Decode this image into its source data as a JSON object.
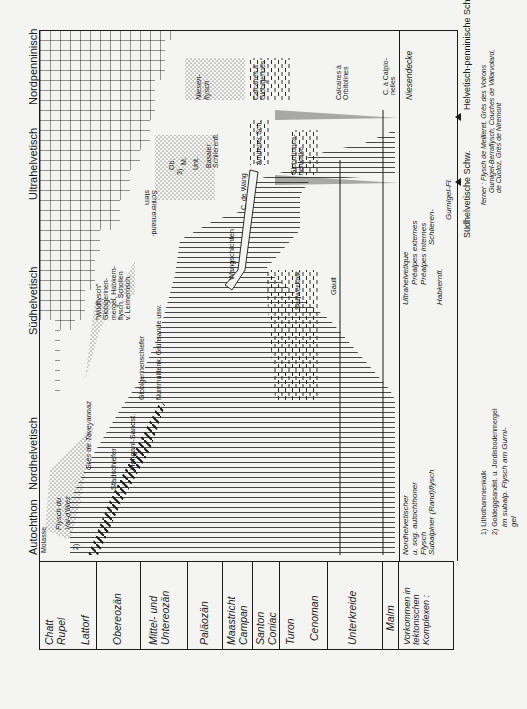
{
  "diagram": {
    "title_headers": [
      {
        "label": "Autochthon",
        "x": 40
      },
      {
        "label": "Nordhelvetisch",
        "x": 100
      },
      {
        "label": "Südhelvetisch",
        "x": 250
      },
      {
        "label": "Ultrahelvetisch",
        "x": 405
      },
      {
        "label": "Nordpenninisch",
        "x": 585
      }
    ],
    "time_column": [
      {
        "lines": [
          "Chatt",
          "Rupel"
        ],
        "sub": "Lattorf",
        "y0": 39,
        "y1": 97
      },
      {
        "lines": [
          "Obereozän"
        ],
        "y0": 97,
        "y1": 141
      },
      {
        "lines": [
          "Mittel- und",
          "Untereozän"
        ],
        "y0": 141,
        "y1": 188
      },
      {
        "lines": [
          "Paläozän"
        ],
        "y0": 188,
        "y1": 223
      },
      {
        "lines": [
          "Maastricht",
          "Campan"
        ],
        "y0": 223,
        "y1": 253
      },
      {
        "lines": [
          "Santon",
          "Coniac"
        ],
        "y0": 253,
        "y1": 280
      },
      {
        "lines": [
          "Turon",
          "Cenoman"
        ],
        "y0": 280,
        "y1": 328
      },
      {
        "lines": [
          "Unterkreide"
        ],
        "y0": 328,
        "y1": 383
      },
      {
        "lines": [
          "Malm"
        ],
        "y0": 383,
        "y1": 399
      },
      {
        "lines": [
          "Vorkommen in",
          "tektonischen",
          "Komplexen :"
        ],
        "y0": 399,
        "y1": 454
      }
    ],
    "units": {
      "molasse": "Molasse",
      "flysch_val_illiez": [
        "Flysch du",
        "Val-d'Illiez"
      ],
      "footnote_2_marker": "2)",
      "gres_taveyannaz": "Grès de Taveyannaz",
      "stadschiefer": "Stadschiefer",
      "hohgant": "Hohgant-Sandst.",
      "nummulitenk": "Nummulitenk. Grünsande usw.",
      "globigerinenschiefer": "Globigerinenschiefer",
      "wildflysch": [
        "\"Wildflysch\"",
        "Globigerinen-",
        "mergel, Habkern-",
        "flysch, Schollen",
        "v. Leimernsch."
      ],
      "wangschichten": "Wangschichten",
      "c_de_wang": "C. de Wang",
      "footnote_3_marker": "3)",
      "schlierensand": [
        "Schlierensand-",
        "stein"
      ],
      "ob_m_unt": [
        "Ob.",
        "M.",
        "Unt."
      ],
      "basaler_schlierenfl": [
        "Basaler",
        "Schlierenfl."
      ],
      "amdener": "Amdener Sch.",
      "globotruncanenkalke": [
        "Globotrunca-",
        "nenkalke"
      ],
      "seewerkalk": "Seewerkalk",
      "gault": "Gault",
      "niesenflysch": [
        "Niesen-",
        "flysch"
      ],
      "calcaires_globigerines": [
        "Calcaires à",
        "Globigerines"
      ],
      "calcaires_orbitolines": [
        "Calcaires à",
        "Orbitolines"
      ],
      "c_calpionelles": [
        "C. à Calpio-",
        "nelles"
      ]
    },
    "vorkommen_row": {
      "nordhelvetisch": [
        "Nordhelvetischer",
        "u. sog. autochthoner",
        "Flysch",
        "Subalpiner (Rand)flysch"
      ],
      "ultrahelvetisch": [
        "Ultrahelvetique",
        "Préalpes externes",
        "Préalpes internes",
        "Schlieren-",
        "Habkernfl.",
        "Gurnigel-Fl."
      ],
      "niesendecke": "Niesendecke"
    },
    "bottom_labels": {
      "suedhelvetische": "Südhelvetische Schw.",
      "helvetisch_penninische": "Helvetisch-penninische Schw.",
      "ferner": [
        "ferner : Flysch de Meilleret, Grès des Voirons",
        "Gurnigel-Berraflysch, Couches de Villarvolard,",
        "de Cucloz, Grès de Niremont"
      ]
    },
    "footnotes": [
      "1) Lithothamnienkalk",
      "2) Goldeggsandst. u. Jordisbodenmergel",
      "im subalp. Flysch am Gurni-",
      "gel"
    ],
    "colors": {
      "ink": "#1a1a1a",
      "paper": "#f4f4f2"
    }
  }
}
